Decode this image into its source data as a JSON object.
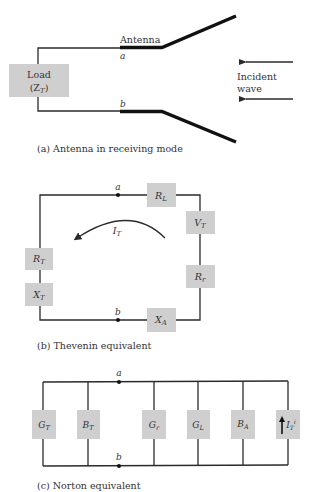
{
  "panel_a": {
    "antenna_label": "Antenna",
    "terminal_a": "a",
    "terminal_b": "b",
    "load_label_line1": "Load",
    "load_label_line2": "(Z",
    "load_label_sub": "T",
    "load_label_close": ")",
    "incident_line1": "Incident",
    "incident_line2": "wave",
    "caption": "(a)  Antenna in receiving mode"
  },
  "panel_b": {
    "terminal_a": "a",
    "terminal_b": "b",
    "current": {
      "main": "I",
      "sub": "T"
    },
    "components": [
      {
        "id": "RL",
        "main": "R",
        "sub": "L"
      },
      {
        "id": "VT",
        "main": "V",
        "sub": "T"
      },
      {
        "id": "Rr",
        "main": "R",
        "sub": "r"
      },
      {
        "id": "RT",
        "main": "R",
        "sub": "T"
      },
      {
        "id": "XT",
        "main": "X",
        "sub": "T"
      },
      {
        "id": "XA",
        "main": "X",
        "sub": "A"
      }
    ],
    "caption": "(b)  Thevenin equivalent"
  },
  "panel_c": {
    "terminal_a": "a",
    "terminal_b": "b",
    "components": [
      {
        "id": "GT",
        "main": "G",
        "sub": "T"
      },
      {
        "id": "BT",
        "main": "B",
        "sub": "T"
      },
      {
        "id": "Gr",
        "main": "G",
        "sub": "r"
      },
      {
        "id": "GL",
        "main": "G",
        "sub": "L"
      },
      {
        "id": "BA",
        "main": "B",
        "sub": "A"
      },
      {
        "id": "IT",
        "main": "I",
        "sub": "T",
        "sup": "i"
      }
    ],
    "caption": "(c)  Norton equivalent"
  },
  "colors": {
    "box_fill": "#cfcfcf",
    "wire": "#2a2a2a",
    "text": "#333333"
  }
}
